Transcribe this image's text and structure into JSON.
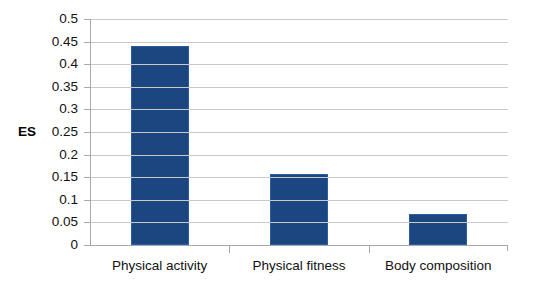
{
  "chart_data": {
    "type": "bar",
    "title": "",
    "xlabel": "",
    "ylabel": "ES",
    "categories": [
      "Physical activity",
      "Physical fitness",
      "Body composition"
    ],
    "values": [
      0.441,
      0.157,
      0.068
    ],
    "ylim": [
      0,
      0.5
    ],
    "ytick_step": 0.05,
    "ytick_labels": [
      "0.5",
      "0.45",
      "0.4",
      "0.35",
      "0.3",
      "0.25",
      "0.2",
      "0.15",
      "0.1",
      "0.05",
      "0"
    ],
    "ytick_values": [
      0.5,
      0.45,
      0.4,
      0.35,
      0.3,
      0.25,
      0.2,
      0.15,
      0.1,
      0.05,
      0
    ],
    "grid": true,
    "grid_axis": "y",
    "legend": false,
    "legend_position": "none",
    "series": [
      {
        "name": "ES",
        "color": "#1B4680",
        "values": [
          0.441,
          0.157,
          0.068
        ]
      }
    ]
  },
  "axis": {
    "y_title": "ES",
    "y_title_at_value": 0.25
  },
  "colors": {
    "bar_fill": "#1B4680",
    "bar_stroke": "#2A5EA0",
    "gridline": "#C9C9C9",
    "axis_line": "#A8A8A8",
    "background": "#FFFFFF",
    "text": "#111111"
  }
}
